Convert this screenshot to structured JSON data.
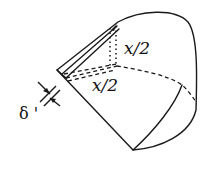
{
  "diagram": {
    "labels": {
      "upper_dimension": "x/2",
      "lower_dimension": "x/2",
      "thickness": "δ '"
    },
    "colors": {
      "stroke": "#1a1a1a",
      "background": "#ffffff"
    }
  }
}
